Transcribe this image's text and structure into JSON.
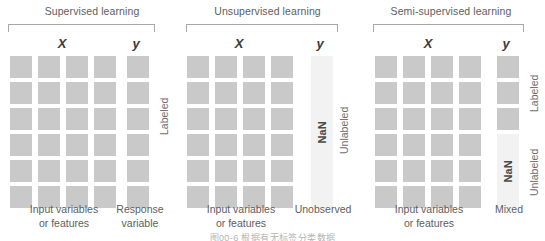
{
  "figure": {
    "caption": "图00-6 根据有无标签分类数据"
  },
  "panels": [
    {
      "id": "supervised",
      "title": "Supervised learning",
      "x_header": "X",
      "y_header": "y",
      "x_caption": "Input variables\nor features",
      "y_caption": "Response\nvariable",
      "x_caption_line1": "Input variables",
      "x_caption_line2": "or features",
      "y_caption_line1": "Response",
      "y_caption_line2": "variable",
      "grid": {
        "rows": 6,
        "cols": 4,
        "fill": "#c9c9c9"
      },
      "y_column": {
        "type": "squares",
        "count": 6,
        "fill": "#c9c9c9"
      },
      "side_labels": [
        {
          "text": "Labeled",
          "span": "all-rows"
        }
      ]
    },
    {
      "id": "unsupervised",
      "title": "Unsupervised learning",
      "x_header": "X",
      "y_header": "y",
      "x_caption_line1": "Input variables",
      "x_caption_line2": "or features",
      "y_caption_line1": "Unobserved",
      "y_caption_line2": "",
      "grid": {
        "rows": 6,
        "cols": 4,
        "fill": "#c9c9c9"
      },
      "y_column": {
        "type": "nan-bar",
        "label": "NaN",
        "fill": "#f2f2f2"
      },
      "side_labels": [
        {
          "text": "Unlabeled",
          "span": "all-rows"
        }
      ]
    },
    {
      "id": "semi-supervised",
      "title": "Semi-supervised learning",
      "x_header": "X",
      "y_header": "y",
      "x_caption_line1": "Input variables",
      "x_caption_line2": "or features",
      "y_caption_line1": "Mixed",
      "y_caption_line2": "",
      "grid": {
        "rows": 6,
        "cols": 4,
        "fill": "#c9c9c9"
      },
      "y_column": {
        "type": "mixed",
        "labeled_squares": 3,
        "nan_label": "NaN",
        "square_fill": "#c9c9c9",
        "nan_fill": "#f2f2f2"
      },
      "side_labels": [
        {
          "text": "Labeled",
          "span": "top-3-rows"
        },
        {
          "text": "Unlabeled",
          "span": "bottom-3-rows"
        }
      ]
    }
  ],
  "colors": {
    "cell": "#c9c9c9",
    "nan_cell": "#f2f2f2",
    "text": "#6e6e6e",
    "header_text": "#3a3a3a",
    "bracket": "#a8a8a8",
    "background": "#ffffff"
  }
}
